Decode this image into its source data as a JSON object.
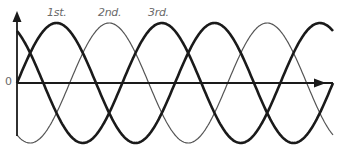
{
  "diagram": {
    "origin_label": "0",
    "phase_labels": [
      "1st.",
      "2nd.",
      "3rd."
    ],
    "colors": {
      "thick": "#1a1a1a",
      "thin": "#555555",
      "axis": "#1a1a1a",
      "label": "#6a6a6a"
    }
  },
  "chart_data": {
    "type": "line",
    "title": "",
    "xlabel": "",
    "ylabel": "",
    "origin_label": "0",
    "grid": false,
    "legend": "none",
    "annotations": [
      "1st.",
      "2nd.",
      "3rd."
    ],
    "series": [
      {
        "name": "1st.",
        "style": "thick",
        "phase_deg": 0,
        "amplitude": 1,
        "cycles_shown": 2
      },
      {
        "name": "2nd.",
        "style": "thin",
        "phase_deg": -120,
        "amplitude": 1,
        "cycles_shown": 2
      },
      {
        "name": "3rd.",
        "style": "thick",
        "phase_deg": -240,
        "amplitude": 1,
        "cycles_shown": 2
      }
    ]
  }
}
